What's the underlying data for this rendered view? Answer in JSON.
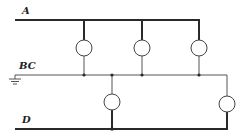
{
  "diagram": {
    "type": "circuit",
    "colors": {
      "wire": "#2a2a2a",
      "thin_wire": "#555555",
      "lamp_stroke": "#444444",
      "lamp_fill": "#ffffff",
      "background": "#ffffff"
    },
    "labels": {
      "line_a": "A",
      "line_bc": "BC",
      "line_d": "D"
    },
    "lines": [
      {
        "id": "A",
        "y": 20,
        "x_start": 15,
        "x_end": 199
      },
      {
        "id": "BC",
        "y": 75,
        "x_start": 15,
        "x_end": 227
      },
      {
        "id": "D",
        "y": 129,
        "x_start": 15,
        "x_end": 227
      }
    ],
    "lamps": [
      {
        "id": "lamp-1",
        "between": [
          "A",
          "BC"
        ],
        "cx": 84,
        "cy": 48,
        "r": 8
      },
      {
        "id": "lamp-2",
        "between": [
          "A",
          "BC"
        ],
        "cx": 142,
        "cy": 48,
        "r": 8
      },
      {
        "id": "lamp-3",
        "between": [
          "A",
          "BC"
        ],
        "cx": 199,
        "cy": 48,
        "r": 8
      },
      {
        "id": "lamp-4",
        "between": [
          "BC",
          "D"
        ],
        "cx": 112,
        "cy": 102,
        "r": 8
      },
      {
        "id": "lamp-5",
        "between": [
          "BC",
          "D"
        ],
        "cx": 227,
        "cy": 104,
        "r": 8
      }
    ],
    "ground": {
      "attached_to": "BC",
      "x": 15,
      "y": 75
    }
  }
}
